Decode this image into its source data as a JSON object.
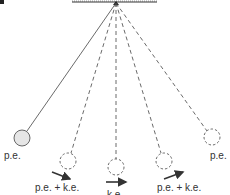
{
  "diagram": {
    "type": "pendulum-energy",
    "colors": {
      "line": "#444444",
      "bob_fill": "#e6e6e6",
      "text": "#333333",
      "arrow": "#333333"
    },
    "pivot": {
      "x": 116,
      "y": 3
    },
    "ceiling": {
      "x1": 72,
      "x2": 157,
      "y": 1
    },
    "bobs": [
      {
        "x": 22,
        "y": 138,
        "r": 8,
        "style": "solid",
        "label": "p.e."
      },
      {
        "x": 68,
        "y": 161,
        "r": 8,
        "style": "dashed",
        "label": "p.e. + k.e."
      },
      {
        "x": 116,
        "y": 167,
        "r": 8,
        "style": "dashed",
        "label": "k.e."
      },
      {
        "x": 164,
        "y": 161,
        "r": 8,
        "style": "dashed",
        "label": "p.e. + k.e."
      },
      {
        "x": 212,
        "y": 137,
        "r": 8,
        "style": "dashed",
        "label": "p.e."
      }
    ],
    "labels": {
      "left_pe": "p.e.",
      "left_pe_ke": "p.e. + k.e.",
      "bottom_ke": "k.e.",
      "right_pe_ke": "p.e. + k.e.",
      "right_pe": "p.e."
    }
  }
}
